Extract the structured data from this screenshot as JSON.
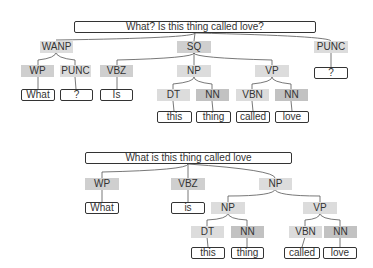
{
  "tree1": {
    "sentence": "What? Is this thing called love?",
    "nodes": {
      "wanp": "WANP",
      "wp": "WP",
      "punc1": "PUNC",
      "vbz": "VBZ",
      "sq": "SQ",
      "np": "NP",
      "dt": "DT",
      "nn1": "NN",
      "vp": "VP",
      "vbn": "VBN",
      "nn2": "NN",
      "punc2": "PUNC"
    },
    "leaves": {
      "what": "What",
      "q1": "?",
      "is": "Is",
      "this": "this",
      "thing": "thing",
      "called": "called",
      "love": "love",
      "q2": "?"
    }
  },
  "tree2": {
    "sentence": "What is this thing called love",
    "nodes": {
      "wp": "WP",
      "vbz": "VBZ",
      "np_top": "NP",
      "np": "NP",
      "dt": "DT",
      "nn1": "NN",
      "vp": "VP",
      "vbn": "VBN",
      "nn2": "NN"
    },
    "leaves": {
      "what": "What",
      "is": "is",
      "this": "this",
      "thing": "thing",
      "called": "called",
      "love": "love"
    }
  }
}
